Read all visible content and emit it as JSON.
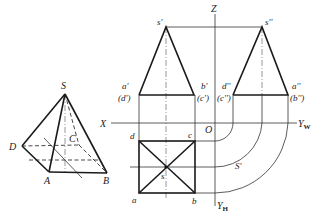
{
  "figure": {
    "pyramid_3d": {
      "vertices": {
        "S": "S",
        "A": "A",
        "B": "B",
        "C": "C",
        "D": "D"
      }
    },
    "front_view": {
      "apex": "s'",
      "left_top": "a'",
      "left_bottom": "(d')",
      "right_top": "b'",
      "right_bottom": "(c')"
    },
    "side_view": {
      "apex": "s''",
      "left_top": "d''",
      "left_bottom": "(c'')",
      "right_top": "a''",
      "right_bottom": "(b'')"
    },
    "top_view": {
      "d": "d",
      "c": "c",
      "a": "a",
      "b": "b",
      "s": "s",
      "arc_label": "S'"
    },
    "axes": {
      "x": "X",
      "z": "Z",
      "origin": "O",
      "yw_main": "Y",
      "yw_sub": "W",
      "yh_main": "Y",
      "yh_sub": "H"
    }
  }
}
